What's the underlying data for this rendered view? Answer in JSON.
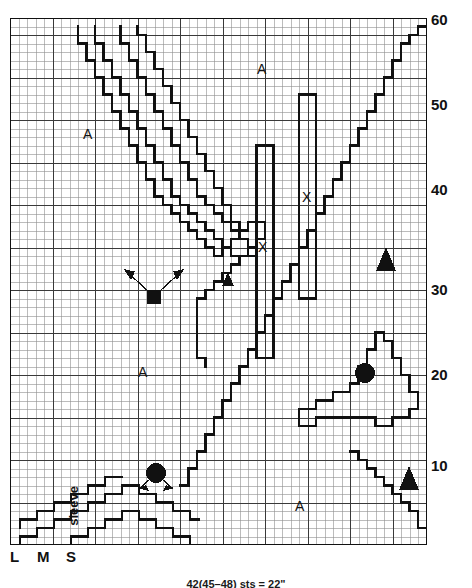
{
  "chart_data": {
    "type": "table",
    "grid": {
      "columns": 49,
      "rows": 62,
      "cell_px": 8.5,
      "minor_grid": true,
      "major_grid_every": 5,
      "minor_color": "#8a8a8a",
      "major_color": "#2b2b2b",
      "border_color": "#111111"
    },
    "y_axis": {
      "side": "right",
      "ticks": [
        10,
        20,
        30,
        40,
        50,
        60
      ],
      "min": 0,
      "max": 62
    },
    "x_axis": {
      "side": "bottom",
      "size_labels": [
        "L",
        "M",
        "S"
      ]
    },
    "annotations": [
      {
        "text": "A",
        "x": 9,
        "y": 52
      },
      {
        "text": "A",
        "x": 28,
        "y": 57
      },
      {
        "text": "A",
        "x": 14,
        "y": 23
      },
      {
        "text": "A",
        "x": 32,
        "y": 6
      },
      {
        "text": "X",
        "x": 27,
        "y": 34
      },
      {
        "text": "X",
        "x": 35,
        "y": 41
      }
    ],
    "symbols": [
      {
        "shape": "square",
        "x": 17,
        "y": 32,
        "arrows": 2
      },
      {
        "shape": "triangle",
        "x": 25,
        "y": 30
      },
      {
        "shape": "triangle",
        "x": 44,
        "y": 36
      },
      {
        "shape": "triangle",
        "x": 44,
        "y": 10
      },
      {
        "shape": "circle",
        "x": 43,
        "y": 21
      },
      {
        "shape": "circle",
        "x": 16,
        "y": 12,
        "arrows": 2
      }
    ]
  },
  "axis": {
    "y_ticks": [
      {
        "label": "60",
        "value": 60
      },
      {
        "label": "50",
        "value": 50
      },
      {
        "label": "40",
        "value": 40
      },
      {
        "label": "30",
        "value": 30
      },
      {
        "label": "20",
        "value": 20
      },
      {
        "label": "10",
        "value": 10
      }
    ],
    "sizes": [
      {
        "label": "L"
      },
      {
        "label": "M"
      },
      {
        "label": "S"
      }
    ]
  },
  "labels": {
    "sleeve": "sleeve",
    "marker_a": "A",
    "marker_x": "X"
  },
  "caption": {
    "text": "42(45–48) sts = 22\""
  }
}
